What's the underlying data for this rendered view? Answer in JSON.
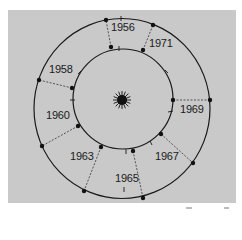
{
  "diagram": {
    "title": "",
    "center": {
      "x": 122,
      "y": 100
    },
    "inner_orbit_radius": 49,
    "outer_orbit_radius": 90,
    "colors": {
      "background": "#c9c9c9",
      "line": "#1a1a1a",
      "page": "#ffffff"
    },
    "central_body": "sun-icon",
    "years": [
      {
        "label": "1956",
        "inner": [
          111,
          47
        ],
        "outer": [
          106,
          20
        ],
        "label_pos": [
          111,
          22
        ]
      },
      {
        "label": "1971",
        "inner": [
          143,
          50
        ],
        "outer": [
          153,
          25
        ],
        "label_pos": [
          149,
          38
        ]
      },
      {
        "label": "1969",
        "inner": [
          173,
          100
        ],
        "outer": [
          210,
          100
        ],
        "label_pos": [
          180,
          104
        ]
      },
      {
        "label": "1967",
        "inner": [
          161,
          134
        ],
        "outer": [
          193,
          163
        ],
        "label_pos": [
          155,
          151
        ]
      },
      {
        "label": "1965",
        "inner": [
          133,
          151
        ],
        "outer": [
          143,
          198
        ],
        "label_pos": [
          115,
          173
        ]
      },
      {
        "label": "1963",
        "inner": [
          101,
          147
        ],
        "outer": [
          84,
          191
        ],
        "label_pos": [
          70,
          151
        ]
      },
      {
        "label": "1960",
        "inner": [
          78,
          126
        ],
        "outer": [
          42,
          146
        ],
        "label_pos": [
          46,
          110
        ]
      },
      {
        "label": "1958",
        "inner": [
          72,
          88
        ],
        "outer": [
          39,
          80
        ],
        "label_pos": [
          49,
          64
        ]
      }
    ]
  }
}
